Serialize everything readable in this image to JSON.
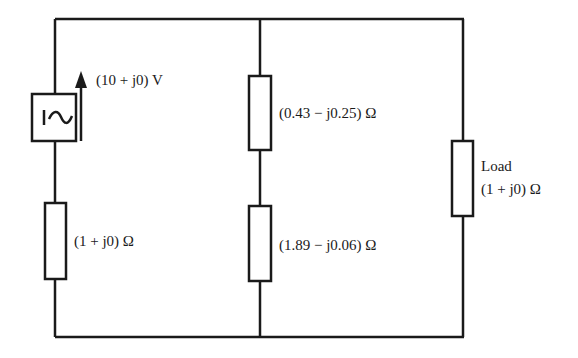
{
  "diagram": {
    "type": "circuit",
    "colors": {
      "wire": "#1a1a1a",
      "background": "#ffffff"
    },
    "source": {
      "symbol": "ac-voltage-source-icon",
      "label": "(10 + j0) V"
    },
    "branches": {
      "left": {
        "resistor_label": "(1 + j0) Ω"
      },
      "middle": {
        "upper_resistor_label": "(0.43 − j0.25) Ω",
        "lower_resistor_label": "(1.89 − j0.06) Ω"
      },
      "right": {
        "load_title": "Load",
        "load_value": "(1 + j0) Ω"
      }
    }
  }
}
